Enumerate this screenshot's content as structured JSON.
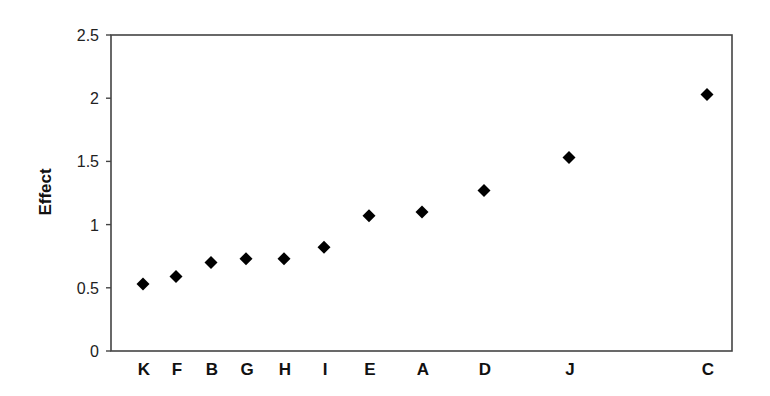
{
  "chart_data": {
    "type": "scatter",
    "title": "",
    "xlabel": "",
    "ylabel": "Effect",
    "ylim": [
      0,
      2.5
    ],
    "yticks": [
      "0",
      "0.5",
      "1",
      "1.5",
      "2",
      "2.5"
    ],
    "grid": false,
    "legend": null,
    "marker": "diamond",
    "marker_color": "#000000",
    "categories": [
      "K",
      "F",
      "B",
      "G",
      "H",
      "I",
      "E",
      "A",
      "D",
      "J",
      "C"
    ],
    "values": [
      0.53,
      0.59,
      0.7,
      0.73,
      0.73,
      0.82,
      1.07,
      1.1,
      1.27,
      1.53,
      2.03
    ],
    "x_pixel_positions": [
      143,
      176,
      211,
      246,
      284,
      324,
      369,
      422,
      484,
      569,
      707
    ]
  },
  "layout": {
    "plot": {
      "left": 111,
      "top": 35,
      "right": 732,
      "bottom": 351
    }
  }
}
